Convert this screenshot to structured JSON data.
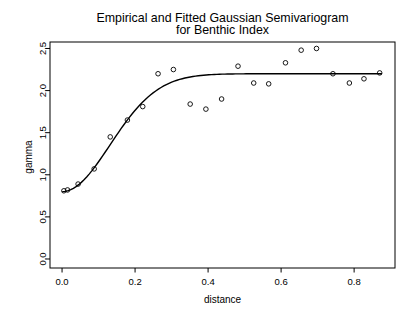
{
  "chart_data": {
    "type": "scatter",
    "title_line1": "Empirical and Fitted Gaussian Semivariogram",
    "title_line2": "for Benthic Index",
    "xlabel": "distance",
    "ylabel": "gamma",
    "x_tick_labels": [
      "0.0",
      "0.2",
      "0.4",
      "0.6",
      "0.8"
    ],
    "x_tick_values": [
      0.0,
      0.2,
      0.4,
      0.6,
      0.8
    ],
    "y_tick_labels": [
      "0.0",
      "0.5",
      "1.0",
      "1.5",
      "2.0",
      "2.5"
    ],
    "y_tick_values": [
      0.0,
      0.5,
      1.0,
      1.5,
      2.0,
      2.5
    ],
    "xlim": [
      -0.033,
      0.912
    ],
    "ylim": [
      -0.107,
      2.577
    ],
    "grid": false,
    "legend": "none",
    "marker": "open-circle",
    "colors": {
      "points": "#000000",
      "curve": "#000000",
      "axis": "#000000",
      "background": "#ffffff"
    },
    "empirical_points": {
      "distance": [
        0.005,
        0.015,
        0.044,
        0.088,
        0.132,
        0.179,
        0.221,
        0.263,
        0.305,
        0.351,
        0.394,
        0.437,
        0.482,
        0.525,
        0.566,
        0.612,
        0.655,
        0.697,
        0.742,
        0.787,
        0.827,
        0.87
      ],
      "gamma": [
        0.81,
        0.82,
        0.89,
        1.07,
        1.45,
        1.65,
        1.81,
        2.2,
        2.25,
        1.84,
        1.78,
        1.9,
        2.29,
        2.09,
        2.08,
        2.33,
        2.48,
        2.5,
        2.2,
        2.09,
        2.14,
        2.21
      ]
    },
    "fitted_model": {
      "model": "gaussian",
      "nugget": 0.8,
      "partial_sill": 1.4,
      "sill": 2.2,
      "range_parameter": 0.185,
      "curve_domain": [
        0.002,
        0.875
      ]
    }
  }
}
